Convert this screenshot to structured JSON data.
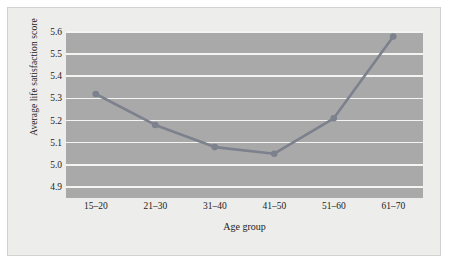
{
  "chart_data": {
    "type": "line",
    "title": "",
    "xlabel": "Age group",
    "ylabel": "Average life satisfaction score",
    "categories": [
      "15–20",
      "21–30",
      "31–40",
      "41–50",
      "51–60",
      "61–70"
    ],
    "values": [
      5.32,
      5.18,
      5.08,
      5.05,
      5.21,
      5.58
    ],
    "series": [
      {
        "name": "Average life satisfaction score",
        "values": [
          5.32,
          5.18,
          5.08,
          5.05,
          5.21,
          5.58
        ]
      }
    ],
    "ylim": [
      4.85,
      5.6
    ],
    "yticks": [
      4.9,
      5.0,
      5.1,
      5.2,
      5.3,
      5.4,
      5.5,
      5.6
    ],
    "ytick_labels": [
      "4.9",
      "5.0",
      "5.1",
      "5.2",
      "5.3",
      "5.4",
      "5.5",
      "5.6"
    ],
    "grid": true,
    "legend": false,
    "colors": {
      "plot_background": "#a9a9a9",
      "figure_background": "#ededeb",
      "gridline": "#f4f4f2",
      "line": "#7c818d",
      "marker": "#7c818d",
      "text": "#1c1c1c"
    },
    "marker": "circle"
  }
}
